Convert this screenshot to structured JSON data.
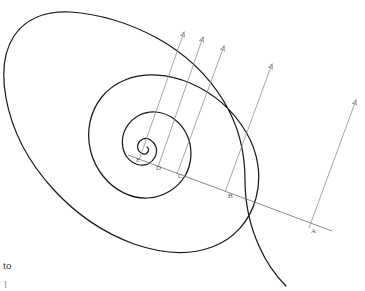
{
  "figure": {
    "background_color": "#ffffff",
    "spiral_color": "#1a1a1a",
    "ray_color": "#6e6e6e",
    "arrow_color": "#8a8a8a",
    "label_color": "#5a5a5a",
    "width": 365,
    "height": 291
  },
  "points": [
    {
      "id": "A",
      "label": "A",
      "x": 305,
      "y": 222,
      "label_x": 311,
      "label_y": 231
    },
    {
      "id": "B",
      "label": "B",
      "x": 225,
      "y": 192,
      "label_x": 228,
      "label_y": 196
    },
    {
      "id": "C",
      "label": "C",
      "x": 177,
      "y": 174,
      "label_x": 178,
      "label_y": 176
    },
    {
      "id": "D",
      "label": "D",
      "x": 158,
      "y": 167,
      "label_x": 157,
      "label_y": 168
    },
    {
      "id": "E",
      "label": "E",
      "x": 139,
      "y": 160,
      "label_x": 137,
      "label_y": 160
    }
  ],
  "arrows": [
    {
      "from": "E",
      "tip_x": 184,
      "tip_y": 29
    },
    {
      "from": "D",
      "tip_x": 203,
      "tip_y": 34
    },
    {
      "from": "C",
      "tip_x": 224,
      "tip_y": 43
    },
    {
      "from": "B",
      "tip_x": 272,
      "tip_y": 61
    },
    {
      "from": "A",
      "tip_x": 356,
      "tip_y": 97
    }
  ],
  "ray": {
    "name": "radial-line",
    "x1": 128,
    "y1": 155,
    "x2": 332,
    "y2": 231
  },
  "pole": {
    "x": 130,
    "y": 152
  },
  "caption": {
    "line1": "to",
    "line2": "l"
  }
}
